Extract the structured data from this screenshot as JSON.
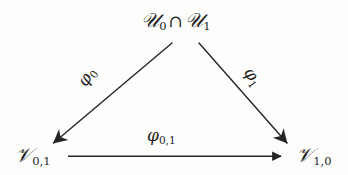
{
  "diagram": {
    "type": "commutative-triangle",
    "background_color": "#fdfdfc",
    "ink_color": "#232120",
    "nodes": [
      {
        "id": "top",
        "role": "apex",
        "text": "𝒰₀ ∩ 𝒰₁",
        "base_symbol": "U",
        "parts": {
          "left_set": "U",
          "left_sub": "0",
          "operator": "∩",
          "right_set": "U",
          "right_sub": "1"
        },
        "x": 185,
        "y": 22
      },
      {
        "id": "bottom-left",
        "role": "target-left",
        "text": "𝒱₀,₁",
        "base_symbol": "V",
        "parts": {
          "set": "V",
          "sub": "0,1"
        },
        "x": 40,
        "y": 157
      },
      {
        "id": "bottom-right",
        "role": "target-right",
        "text": "𝒱₁,₀",
        "base_symbol": "V",
        "parts": {
          "set": "V",
          "sub": "1,0"
        },
        "x": 316,
        "y": 157
      }
    ],
    "edges": [
      {
        "id": "edge-phi0",
        "from": "top",
        "to": "bottom-left",
        "label": "φ₀",
        "label_base": "φ",
        "label_sub": "0",
        "label_rotation_deg": -56,
        "arrowhead": "open-thin",
        "x1": 172,
        "y1": 43,
        "x2": 50,
        "y2": 146
      },
      {
        "id": "edge-phi1",
        "from": "top",
        "to": "bottom-right",
        "label": "φ₁",
        "label_base": "φ",
        "label_sub": "1",
        "label_rotation_deg": 56,
        "arrowhead": "open-thin",
        "x1": 199,
        "y1": 43,
        "x2": 290,
        "y2": 146
      },
      {
        "id": "edge-phi01",
        "from": "bottom-left",
        "to": "bottom-right",
        "label": "φ₀,₁",
        "label_base": "φ",
        "label_sub": "0,1",
        "label_rotation_deg": 0,
        "arrowhead": "solid-triangle",
        "x1": 68,
        "y1": 156,
        "x2": 283,
        "y2": 156
      }
    ]
  }
}
